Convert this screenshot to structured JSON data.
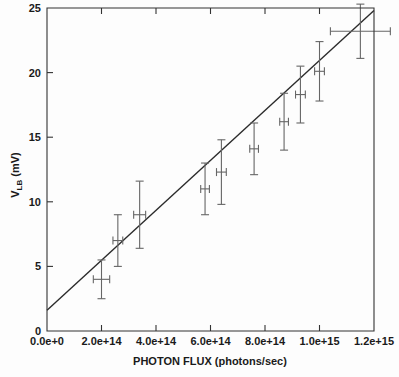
{
  "chart_data": {
    "type": "scatter",
    "title": "",
    "xlabel": "PHOTON FLUX (photons/sec)",
    "ylabel": "V_LB (mV)",
    "ylabel_base": "V",
    "ylabel_subscript": "LB",
    "ylabel_units": "(mV)",
    "xlim": [
      0,
      1200000000000000.0
    ],
    "ylim": [
      0,
      25
    ],
    "grid": false,
    "legend": null,
    "xticks": [
      0,
      200000000000000.0,
      400000000000000.0,
      600000000000000.0,
      800000000000000.0,
      1000000000000000.0,
      1200000000000000.0
    ],
    "xtick_labels": [
      "0.0e+0",
      "2.0e+14",
      "4.0e+14",
      "6.0e+14",
      "8.0e+14",
      "1.0e+15",
      "1.2e+15"
    ],
    "yticks": [
      0,
      5,
      10,
      15,
      20,
      25
    ],
    "ytick_labels": [
      "0",
      "5",
      "10",
      "15",
      "20",
      "25"
    ],
    "series": [
      {
        "name": "measurements",
        "marker": "errorbar-cross",
        "color": "#666666",
        "points": [
          {
            "x": 200000000000000.0,
            "y": 4.0,
            "yerr_low": 1.5,
            "yerr_high": 1.5,
            "xerr": 30000000000000.0
          },
          {
            "x": 260000000000000.0,
            "y": 7.0,
            "yerr_low": 2.0,
            "yerr_high": 2.0,
            "xerr": 18000000000000.0
          },
          {
            "x": 340000000000000.0,
            "y": 9.0,
            "yerr_low": 2.6,
            "yerr_high": 2.6,
            "xerr": 22000000000000.0
          },
          {
            "x": 580000000000000.0,
            "y": 11.0,
            "yerr_low": 2.0,
            "yerr_high": 2.0,
            "xerr": 16000000000000.0
          },
          {
            "x": 640000000000000.0,
            "y": 12.3,
            "yerr_low": 2.5,
            "yerr_high": 2.5,
            "xerr": 18000000000000.0
          },
          {
            "x": 760000000000000.0,
            "y": 14.1,
            "yerr_low": 2.0,
            "yerr_high": 2.0,
            "xerr": 16000000000000.0
          },
          {
            "x": 870000000000000.0,
            "y": 16.2,
            "yerr_low": 2.2,
            "yerr_high": 2.2,
            "xerr": 16000000000000.0
          },
          {
            "x": 930000000000000.0,
            "y": 18.3,
            "yerr_low": 2.2,
            "yerr_high": 2.2,
            "xerr": 18000000000000.0
          },
          {
            "x": 1000000000000000.0,
            "y": 20.1,
            "yerr_low": 2.3,
            "yerr_high": 2.3,
            "xerr": 18000000000000.0
          },
          {
            "x": 1150000000000000.0,
            "y": 23.2,
            "yerr_low": 2.1,
            "yerr_high": 2.1,
            "xerr": 110000000000000.0
          }
        ]
      }
    ],
    "fit": {
      "name": "linear fit",
      "type": "line",
      "color": "#2b2b2b",
      "x_start": 0,
      "y_start": 1.6,
      "x_end": 1200000000000000.0,
      "y_end": 24.8
    }
  }
}
